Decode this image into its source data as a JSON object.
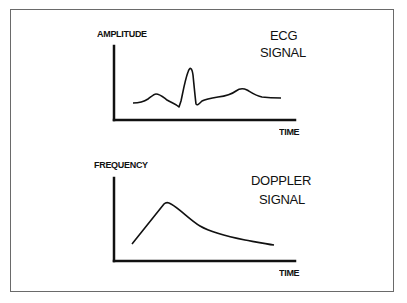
{
  "ecg": {
    "title_line1": "ECG",
    "title_line2": "SIGNAL",
    "y_label": "AMPLITUDE",
    "x_label": "TIME"
  },
  "doppler": {
    "title_line1": "DOPPLER",
    "title_line2": "SIGNAL",
    "y_label": "FREQUENCY",
    "x_label": "TIME"
  },
  "colors": {
    "line": "#111111",
    "frame": "#6a6a6a",
    "background": "#ffffff"
  }
}
